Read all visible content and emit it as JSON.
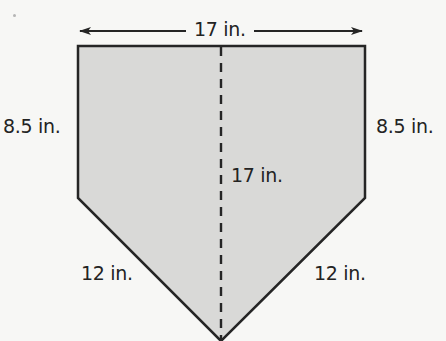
{
  "figure": {
    "shape": "pentagon (home plate)",
    "fill_color": "#d9d9d7",
    "stroke_color": "#252525",
    "background_color": "#f7f7f5",
    "vertices": [
      [
        78,
        46
      ],
      [
        365,
        46
      ],
      [
        365,
        198
      ],
      [
        221,
        341
      ],
      [
        78,
        198
      ]
    ],
    "dashed_line": {
      "x1": 221,
      "y1": 46,
      "x2": 221,
      "y2": 341
    }
  },
  "labels": {
    "top_width": "17 in.",
    "left_side": "8.5 in.",
    "right_side": "8.5 in.",
    "center_height": "17 in.",
    "lower_left_side": "12 in.",
    "lower_right_side": "12 in."
  },
  "dimensions": {
    "width_in": 17,
    "side_height_in": 8.5,
    "total_height_in": 17,
    "slant_side_in": 12
  }
}
